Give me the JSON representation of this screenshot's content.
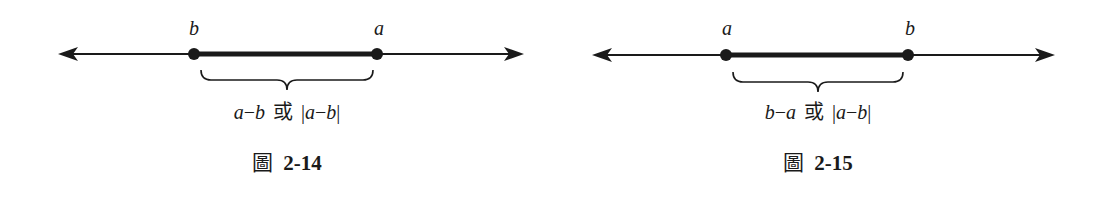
{
  "figures": [
    {
      "id": "fig-2-14",
      "left_point_label": "b",
      "right_point_label": "a",
      "expression": {
        "part1": "a",
        "op1": "−",
        "part2": "b",
        "or": "或",
        "abs_open": "|",
        "abs_a": "a",
        "abs_op": "−",
        "abs_b": "b",
        "abs_close": "|"
      },
      "caption_prefix": "圖",
      "caption_number": "2-14"
    },
    {
      "id": "fig-2-15",
      "left_point_label": "a",
      "right_point_label": "b",
      "expression": {
        "part1": "b",
        "op1": "−",
        "part2": "a",
        "or": "或",
        "abs_open": "|",
        "abs_a": "a",
        "abs_op": "−",
        "abs_b": "b",
        "abs_close": "|"
      },
      "caption_prefix": "圖",
      "caption_number": "2-15"
    }
  ],
  "colors": {
    "ink": "#1a1a1a"
  }
}
